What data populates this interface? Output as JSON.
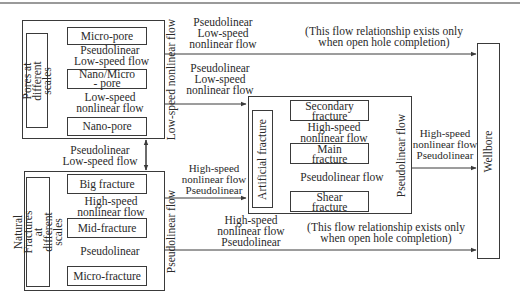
{
  "diagram": {
    "pores_group": {
      "label": "Pores at different scales",
      "nodes": [
        "Micro-pore",
        "Nano/Micro - pore",
        "Nano-pore"
      ],
      "flow_micro_to_nanomicro": [
        "Pseudolinear",
        "Low-speed flow"
      ],
      "flow_nanomicro_to_nano": [
        "Low-speed",
        "nonlinear flow"
      ],
      "side_flow": "Low-speed nonlinear flow"
    },
    "fractures_group": {
      "label": "Natural Fractures at different scales",
      "nodes": [
        "Big fracture",
        "Mid-fracture",
        "Micro-fracture"
      ],
      "flow_big_to_mid": [
        "High-speed",
        "nonlinear flow"
      ],
      "flow_mid_to_micro": "Pseudolinear",
      "side_flow": "Pseudolinear flow"
    },
    "artificial_group": {
      "label": "Artificial fracture",
      "nodes": [
        "Secondary fracture",
        "Main fracture",
        "Shear fracture"
      ],
      "flow_secondary_to_main": [
        "High-speed",
        "nonlinear flow"
      ],
      "flow_main_to_shear": "Pseudolinear flow",
      "side_flow": "Pseudolinear flow"
    },
    "wellbore": {
      "label": "Wellbore"
    },
    "edges": {
      "pores_to_wellbore": [
        "Pseudolinear",
        "Low-speed",
        "nonlinear flow"
      ],
      "pores_to_wellbore_note": [
        "(This flow relationship exists only",
        "when open hole completion)"
      ],
      "pores_to_artificial": [
        "Pseudolinear",
        "Low-speed",
        "nonlinear flow"
      ],
      "pores_fractures_between": [
        "Pseudolinear",
        "Low-speed flow"
      ],
      "fractures_to_artificial": [
        "High-speed",
        "nonlinear flow",
        "Pseudolinear"
      ],
      "artificial_to_wellbore": [
        "High-speed",
        "nonlinear flow",
        "Pseudolinear"
      ],
      "fractures_to_wellbore": [
        "High-speed",
        "nonlinear flow",
        "Pseudolinear"
      ],
      "fractures_to_wellbore_note": [
        "(This flow relationship exists only",
        "when open hole completion)"
      ]
    },
    "colors": {
      "line": "#3a3a3a",
      "text": "#2a2a2a",
      "background": "#ffffff"
    }
  }
}
